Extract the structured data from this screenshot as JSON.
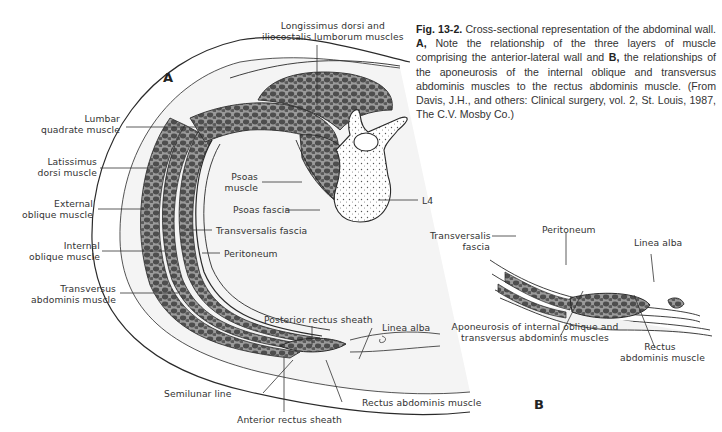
{
  "figure": {
    "number": "Fig. 13-2.",
    "caption_parts": {
      "intro": " Cross-sectional representation of the abdominal wall. ",
      "a_marker": "A,",
      "a_text": " Note the relationship of the three layers of muscle comprising the anterior-lateral wall and ",
      "b_marker": "B,",
      "b_text": " the relationships of the aponeurosis of the internal oblique and transversus abdominis muscles to the rectus abdominis muscle. (From Davis, J.H., and others: Clinical surgery, vol. 2, St. Louis, 1987, The C.V. Mosby Co.)"
    }
  },
  "panel_a": {
    "marker": "A",
    "labels": {
      "longissimus_1": "Longissimus dorsi and",
      "longissimus_2": "iliocostalis lumborum muscles",
      "lumbar_1": "Lumbar",
      "lumbar_2": "quadrate muscle",
      "latissimus_1": "Latissimus",
      "latissimus_2": "dorsi muscle",
      "external_1": "External",
      "external_2": "oblique muscle",
      "internal_1": "Internal",
      "internal_2": "oblique muscle",
      "transversus_1": "Transversus",
      "transversus_2": "abdominis muscle",
      "psoas_1": "Psoas",
      "psoas_2": "muscle",
      "psoas_fascia": "Psoas fascia",
      "l4": "L4",
      "transversalis_fascia": "Transversalis fascia",
      "peritoneum": "Peritoneum",
      "posterior_rectus_sheath": "Posterior rectus sheath",
      "linea_alba": "Linea alba",
      "semilunar_line": "Semilunar line",
      "anterior_rectus_sheath": "Anterior rectus sheath",
      "rectus_abdominis": "Rectus abdominis muscle"
    }
  },
  "panel_b": {
    "marker": "B",
    "labels": {
      "transversalis_1": "Transversalis",
      "transversalis_2": "fascia",
      "peritoneum": "Peritoneum",
      "linea_alba": "Linea alba",
      "aponeurosis_1": "Aponeurosis of internal oblique and",
      "aponeurosis_2": "transversus abdominis muscles",
      "rectus_1": "Rectus",
      "rectus_2": "abdominis muscle"
    }
  },
  "colors": {
    "ink": "#2a2a2a",
    "muscle_fill": "#6f6f6f",
    "fat_fill": "#f1f1f1",
    "background": "#ffffff"
  }
}
